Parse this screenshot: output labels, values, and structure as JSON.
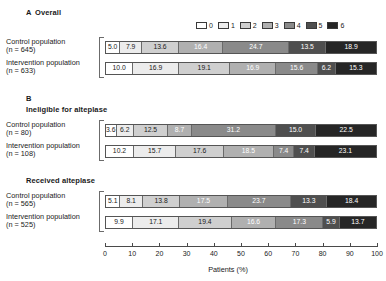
{
  "legend": {
    "items": [
      {
        "label": "0",
        "color": "#ffffff"
      },
      {
        "label": "1",
        "color": "#ececec"
      },
      {
        "label": "2",
        "color": "#cfcfcf"
      },
      {
        "label": "3",
        "color": "#b0b0b0"
      },
      {
        "label": "4",
        "color": "#8a8a8a"
      },
      {
        "label": "5",
        "color": "#4f4f4f"
      },
      {
        "label": "6",
        "color": "#262626"
      }
    ]
  },
  "axis": {
    "title": "Patients (%)",
    "ticks": [
      "0",
      "10",
      "20",
      "30",
      "40",
      "50",
      "60",
      "70",
      "80",
      "90",
      "100"
    ],
    "min": 0,
    "max": 100
  },
  "panels": [
    {
      "letter": "A",
      "title": "Overall",
      "rows": [
        {
          "name": "Control population",
          "n": "(n = 645)",
          "values": [
            "5.0",
            "7.9",
            "13.6",
            "16.4",
            "24.7",
            "13.5",
            "18.9"
          ]
        },
        {
          "name": "Intervention population",
          "n": "(n = 633)",
          "values": [
            "10.0",
            "16.9",
            "19.1",
            "16.9",
            "15.6",
            "6.2",
            "15.3"
          ]
        }
      ]
    },
    {
      "letter": "B",
      "title": "Ineligible for alteplase",
      "rows": [
        {
          "name": "Control population",
          "n": "(n = 80)",
          "values": [
            "3.6",
            "6.2",
            "12.5",
            "8.7",
            "31.2",
            "15.0",
            "22.5"
          ]
        },
        {
          "name": "Intervention population",
          "n": "(n = 108)",
          "values": [
            "10.2",
            "15.7",
            "17.6",
            "18.5",
            "7.4",
            "7.4",
            "23.1"
          ]
        }
      ]
    },
    {
      "letter": "",
      "title": "Received alteplase",
      "rows": [
        {
          "name": "Control population",
          "n": "(n = 565)",
          "values": [
            "5.1",
            "8.1",
            "13.8",
            "17.5",
            "23.7",
            "13.3",
            "18.4"
          ]
        },
        {
          "name": "Intervention population",
          "n": "(n = 525)",
          "values": [
            "9.9",
            "17.1",
            "19.4",
            "16.6",
            "17.3",
            "5.9",
            "13.7"
          ]
        }
      ]
    }
  ],
  "chart_data": {
    "type": "bar",
    "orientation": "horizontal",
    "stacked": true,
    "normalized": true,
    "title": "",
    "xlabel": "Patients (%)",
    "ylabel": "",
    "xlim": [
      0,
      100
    ],
    "grid": false,
    "legend_position": "top-right",
    "legend_title": "",
    "categories": [
      "0",
      "1",
      "2",
      "3",
      "4",
      "5",
      "6"
    ],
    "category_colors": [
      "#ffffff",
      "#ececec",
      "#cfcfcf",
      "#b0b0b0",
      "#8a8a8a",
      "#4f4f4f",
      "#262626"
    ],
    "panels": [
      {
        "label": "A Overall",
        "groups": [
          {
            "name": "Control population (n = 645)",
            "values": [
              5.0,
              7.9,
              13.6,
              16.4,
              24.7,
              13.5,
              18.9
            ]
          },
          {
            "name": "Intervention population (n = 633)",
            "values": [
              10.0,
              16.9,
              19.1,
              16.9,
              15.6,
              6.2,
              15.3
            ]
          }
        ]
      },
      {
        "label": "B Ineligible for alteplase",
        "groups": [
          {
            "name": "Control population (n = 80)",
            "values": [
              3.6,
              6.2,
              12.5,
              8.7,
              31.2,
              15.0,
              22.5
            ]
          },
          {
            "name": "Intervention population (n = 108)",
            "values": [
              10.2,
              15.7,
              17.6,
              18.5,
              7.4,
              7.4,
              23.1
            ]
          }
        ]
      },
      {
        "label": "Received alteplase",
        "groups": [
          {
            "name": "Control population (n = 565)",
            "values": [
              5.1,
              8.1,
              13.8,
              17.5,
              23.7,
              13.3,
              18.4
            ]
          },
          {
            "name": "Intervention population (n = 525)",
            "values": [
              9.9,
              17.1,
              19.4,
              16.6,
              17.3,
              5.9,
              13.7
            ]
          }
        ]
      }
    ]
  }
}
